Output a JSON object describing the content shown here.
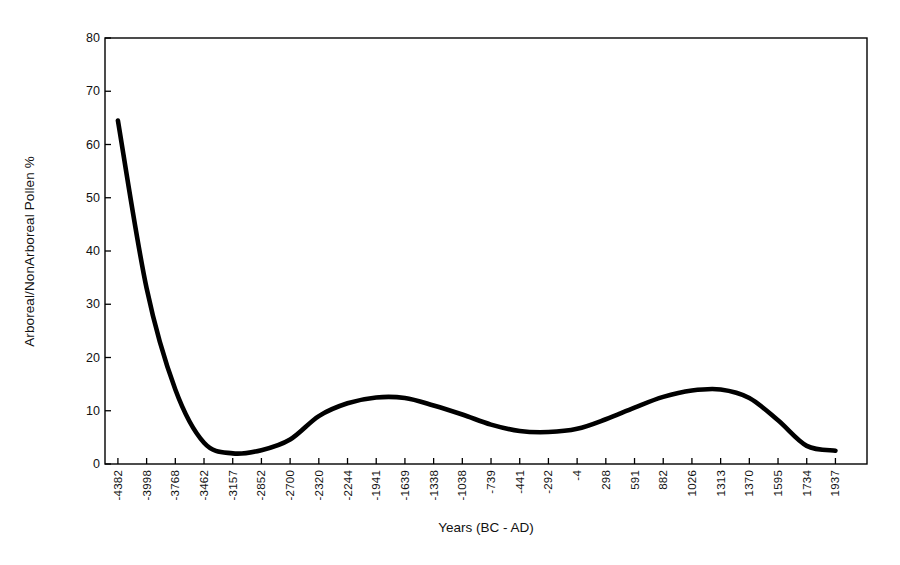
{
  "chart_data": {
    "type": "line",
    "title": "",
    "subtitle": "",
    "xlabel": "Years (BC - AD)",
    "ylabel": "Arboreal/NonArboreal Pollen %",
    "grid": false,
    "legend": false,
    "legend_position": "none",
    "ylim": [
      0,
      80
    ],
    "yticks": [
      0,
      10,
      20,
      30,
      40,
      50,
      60,
      70,
      80
    ],
    "categories": [
      "-4382",
      "-3998",
      "-3768",
      "-3462",
      "-3157",
      "-2852",
      "-2700",
      "-2320",
      "-2244",
      "-1941",
      "-1639",
      "-1338",
      "-1038",
      "-739",
      "-441",
      "-292",
      "-4",
      "298",
      "591",
      "882",
      "1026",
      "1313",
      "1370",
      "1595",
      "1734",
      "1937"
    ],
    "series": [
      {
        "name": "Arboreal/NonArboreal Pollen %",
        "color": "#000000",
        "values": [
          64.5,
          33.0,
          14.0,
          4.0,
          2.0,
          2.6,
          4.6,
          9.0,
          11.4,
          12.5,
          12.4,
          11.0,
          9.3,
          7.4,
          6.2,
          6.0,
          6.6,
          8.4,
          10.6,
          12.6,
          13.8,
          14.0,
          12.4,
          8.2,
          3.4,
          2.5
        ]
      }
    ],
    "annotations": []
  },
  "axes": {
    "y_axis_title": "Arboreal/NonArboreal Pollen %",
    "x_axis_title": "Years (BC - AD)"
  }
}
